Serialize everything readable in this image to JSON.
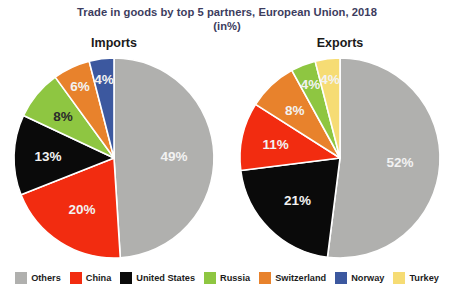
{
  "header": {
    "title": "Trade in goods by top 5 partners, European Union, 2018",
    "subtitle": "(in%)",
    "title_color": "#3c3c5e"
  },
  "panels": {
    "imports_title": "Imports",
    "exports_title": "Exports"
  },
  "legend": {
    "position": "bottom",
    "items": [
      {
        "label": "Others",
        "color": "#b0b0ae"
      },
      {
        "label": "China",
        "color": "#f22c10"
      },
      {
        "label": "United States",
        "color": "#0a0a0a"
      },
      {
        "label": "Russia",
        "color": "#8ec641"
      },
      {
        "label": "Switzerland",
        "color": "#e8822c"
      },
      {
        "label": "Norway",
        "color": "#3c589f"
      },
      {
        "label": "Turkey",
        "color": "#f6dc74"
      }
    ]
  },
  "chart_data": {
    "type": "pie",
    "title": "Trade in goods by top 5 partners, European Union, 2018",
    "subtitle": "(in%)",
    "units": "%",
    "legend_position": "bottom",
    "charts": [
      {
        "name": "imports",
        "title": "Imports",
        "start_angle_deg": 0,
        "direction": "clockwise",
        "labels": [
          "Others",
          "China",
          "United States",
          "Russia",
          "Switzerland",
          "Norway"
        ],
        "values": [
          49,
          20,
          13,
          8,
          6,
          4
        ],
        "colors": [
          "#b0b0ae",
          "#f22c10",
          "#0a0a0a",
          "#8ec641",
          "#e8822c",
          "#3c589f"
        ],
        "data_labels": [
          "49%",
          "20%",
          "13%",
          "8%",
          "6%",
          "4%"
        ],
        "label_colors": [
          "light",
          "light",
          "light",
          "dark",
          "light",
          "light"
        ]
      },
      {
        "name": "exports",
        "title": "Exports",
        "start_angle_deg": 0,
        "direction": "clockwise",
        "labels": [
          "Others",
          "United States",
          "China",
          "Switzerland",
          "Russia",
          "Turkey"
        ],
        "values": [
          52,
          21,
          11,
          8,
          4,
          4
        ],
        "colors": [
          "#b0b0ae",
          "#0a0a0a",
          "#f22c10",
          "#e8822c",
          "#8ec641",
          "#f6dc74"
        ],
        "data_labels": [
          "52%",
          "21%",
          "11%",
          "8%",
          "4%",
          "4%"
        ],
        "label_colors": [
          "light",
          "light",
          "light",
          "light",
          "light",
          "light"
        ]
      }
    ]
  }
}
